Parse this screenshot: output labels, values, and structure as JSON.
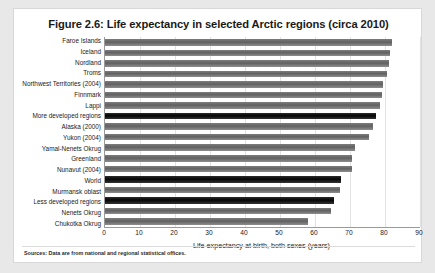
{
  "figure": {
    "title": "Figure 2.6: Life expectancy in selected Arctic regions (circa 2010)",
    "source_note": "Sources: Data are from national and regional statistical offices."
  },
  "colors": {
    "bar_regional": "#6b6b6b",
    "bar_aggregate": "#111111",
    "axis": "#9a9a9a",
    "gridline": "#e2e2e2",
    "card_background": "#ffffff",
    "page_background": "#e8e8e8"
  },
  "chart_data": {
    "type": "bar",
    "orientation": "horizontal",
    "title": "Figure 2.6: Life expectancy in selected Arctic regions (circa 2010)",
    "xlabel": "Life expectancy at birth, both sexes (years)",
    "ylabel": "",
    "xlim": [
      0,
      90
    ],
    "xticks": [
      0,
      10,
      20,
      30,
      40,
      50,
      60,
      70,
      80,
      90
    ],
    "grid": true,
    "legend": false,
    "categories": [
      "Faroe Islands",
      "Iceland",
      "Nordland",
      "Troms",
      "Northwest Territories (2004)",
      "Finnmark",
      "Lappi",
      "More developed regions",
      "Alaska (2000)",
      "Yukon (2004)",
      "Yamal-Nenets Okrug",
      "Greenland",
      "Nunavut (2004)",
      "World",
      "Murmansk oblast",
      "Less developed regions",
      "Nenets Okrug",
      "Chukotka Okrug"
    ],
    "values": [
      82.0,
      81.5,
      81.0,
      80.5,
      79.5,
      79.0,
      78.5,
      77.5,
      76.5,
      75.5,
      71.5,
      70.5,
      70.5,
      67.5,
      67.0,
      65.5,
      64.5,
      58.0
    ],
    "highlighted_categories": [
      "More developed regions",
      "World",
      "Less developed regions"
    ]
  }
}
